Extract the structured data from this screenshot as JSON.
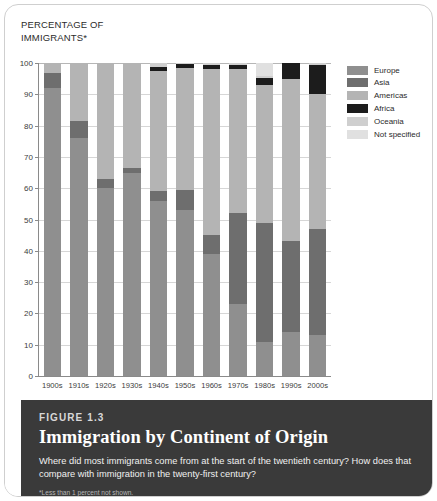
{
  "axis_title": "PERCENTAGE OF\nIMMIGRANTS*",
  "caption": {
    "figure_number": "FIGURE 1.3",
    "title": "Immigration by Continent of Origin",
    "question": "Where did most immigrants come from at the start of the twentieth century? How does that compare with immigration in the twenty-first century?",
    "footnote": "*Less than 1 percent not shown.",
    "source": "SOURCE: Department of Homeland Security, Yearbook of Immigration Statistics, 2009; Persons"
  },
  "legend": {
    "items": [
      {
        "label": "Europe",
        "color": "#8f8f8f"
      },
      {
        "label": "Asia",
        "color": "#6e6e6e"
      },
      {
        "label": "Americas",
        "color": "#b4b4b4"
      },
      {
        "label": "Africa",
        "color": "#1c1c1c"
      },
      {
        "label": "Oceania",
        "color": "#cfcfcf"
      },
      {
        "label": "Not specified",
        "color": "#e0e0e0"
      }
    ]
  },
  "chart_data": {
    "type": "bar",
    "subtype": "stacked-bar-100",
    "title": "Immigration by Continent of Origin",
    "xlabel": "",
    "ylabel": "PERCENTAGE OF IMMIGRANTS*",
    "ylim": [
      0,
      100
    ],
    "yticks": [
      0,
      10,
      20,
      30,
      40,
      50,
      60,
      70,
      80,
      90,
      100
    ],
    "grid": true,
    "legend_position": "right",
    "categories": [
      "1900s",
      "1910s",
      "1920s",
      "1930s",
      "1940s",
      "1950s",
      "1960s",
      "1970s",
      "1980s",
      "1990s",
      "2000s"
    ],
    "series": [
      {
        "name": "Europe",
        "color": "#8f8f8f",
        "values": [
          92.0,
          76.0,
          60.0,
          65.0,
          56.0,
          53.0,
          39.0,
          23.0,
          11.0,
          14.0,
          13.0
        ]
      },
      {
        "name": "Asia",
        "color": "#6e6e6e",
        "values": [
          4.8,
          5.5,
          2.8,
          1.6,
          3.0,
          6.5,
          6.0,
          29.0,
          38.0,
          29.0,
          34.0
        ]
      },
      {
        "name": "Americas",
        "color": "#b4b4b4",
        "values": [
          3.2,
          18.5,
          37.2,
          33.4,
          38.5,
          39.0,
          53.0,
          46.0,
          44.0,
          52.0,
          43.0
        ]
      },
      {
        "name": "Africa",
        "color": "#1c1c1c",
        "values": [
          0.0,
          0.0,
          0.0,
          0.0,
          1.3,
          1.3,
          1.3,
          1.5,
          2.2,
          5.0,
          9.5
        ]
      },
      {
        "name": "Oceania",
        "color": "#cfcfcf",
        "values": [
          0.0,
          0.0,
          0.0,
          0.0,
          1.2,
          0.2,
          0.7,
          0.5,
          0.6,
          0.0,
          0.5
        ]
      },
      {
        "name": "Not specified",
        "color": "#e0e0e0",
        "values": [
          0.0,
          0.0,
          0.0,
          0.0,
          0.0,
          0.0,
          0.0,
          0.0,
          4.2,
          0.0,
          0.0
        ]
      }
    ]
  }
}
